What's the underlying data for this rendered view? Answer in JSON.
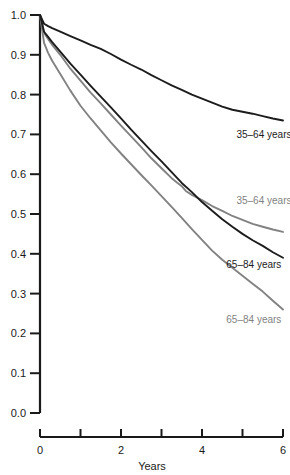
{
  "chart_data": {
    "type": "line",
    "title": "",
    "xlabel": "Years",
    "ylabel": "",
    "xlim": [
      0,
      6
    ],
    "ylim": [
      0,
      1.0
    ],
    "grid": false,
    "legend_position": "inline-annotations",
    "xticks": [
      0,
      1,
      2,
      3,
      4,
      5,
      6
    ],
    "xtick_labels": [
      "0",
      "",
      "2",
      "",
      "4",
      "",
      "6"
    ],
    "yticks": [
      0.0,
      0.1,
      0.2,
      0.3,
      0.4,
      0.5,
      0.6,
      0.7,
      0.8,
      0.9,
      1.0
    ],
    "ytick_labels": [
      "0.0",
      "0.1",
      "0.2",
      "0.3",
      "0.4",
      "0.5",
      "0.6",
      "0.7",
      "0.8",
      "0.9",
      "1.0"
    ],
    "series": [
      {
        "name": "35-64 years (upper)",
        "label": "35–64 years",
        "color": "#1c1c1c",
        "x": [
          0,
          0.1,
          0.2,
          0.3,
          0.5,
          0.75,
          1.0,
          1.25,
          1.5,
          1.75,
          2.0,
          2.25,
          2.5,
          2.75,
          3.0,
          3.25,
          3.5,
          3.75,
          4.0,
          4.25,
          4.5,
          4.75,
          5.0,
          5.25,
          5.5,
          5.75,
          6.0
        ],
        "y": [
          1.0,
          0.978,
          0.972,
          0.967,
          0.958,
          0.947,
          0.936,
          0.925,
          0.915,
          0.902,
          0.888,
          0.875,
          0.863,
          0.849,
          0.836,
          0.823,
          0.812,
          0.8,
          0.79,
          0.78,
          0.77,
          0.762,
          0.757,
          0.752,
          0.746,
          0.74,
          0.735
        ]
      },
      {
        "name": "35-64 years (lower, gray)",
        "label": "35–64 years",
        "color": "#828282",
        "x": [
          0,
          0.1,
          0.2,
          0.3,
          0.5,
          0.75,
          1.0,
          1.25,
          1.5,
          1.75,
          2.0,
          2.25,
          2.5,
          2.75,
          3.0,
          3.25,
          3.5,
          3.6,
          3.75,
          4.0,
          4.25,
          4.5,
          4.75,
          5.0,
          5.25,
          5.5,
          5.75,
          6.0
        ],
        "y": [
          1.0,
          0.955,
          0.94,
          0.925,
          0.9,
          0.865,
          0.835,
          0.805,
          0.778,
          0.75,
          0.722,
          0.695,
          0.668,
          0.64,
          0.615,
          0.59,
          0.57,
          0.558,
          0.548,
          0.535,
          0.52,
          0.508,
          0.495,
          0.485,
          0.475,
          0.468,
          0.461,
          0.455
        ]
      },
      {
        "name": "65-84 years (upper, black)",
        "label": "65–84 years",
        "color": "#1c1c1c",
        "x": [
          0,
          0.1,
          0.2,
          0.3,
          0.5,
          0.75,
          1.0,
          1.25,
          1.5,
          1.75,
          2.0,
          2.25,
          2.5,
          2.75,
          3.0,
          3.25,
          3.5,
          3.75,
          4.0,
          4.25,
          4.5,
          4.75,
          5.0,
          5.25,
          5.5,
          5.75,
          6.0
        ],
        "y": [
          1.0,
          0.958,
          0.945,
          0.932,
          0.908,
          0.878,
          0.85,
          0.822,
          0.795,
          0.768,
          0.74,
          0.712,
          0.685,
          0.658,
          0.632,
          0.605,
          0.578,
          0.555,
          0.53,
          0.508,
          0.487,
          0.468,
          0.45,
          0.434,
          0.42,
          0.404,
          0.39
        ]
      },
      {
        "name": "65-84 years (lower, gray)",
        "label": "65–84 years",
        "color": "#828282",
        "x": [
          0,
          0.1,
          0.2,
          0.3,
          0.5,
          0.75,
          1.0,
          1.25,
          1.5,
          1.75,
          2.0,
          2.25,
          2.5,
          2.75,
          3.0,
          3.25,
          3.5,
          3.75,
          4.0,
          4.25,
          4.5,
          4.75,
          5.0,
          5.25,
          5.5,
          5.75,
          6.0
        ],
        "y": [
          1.0,
          0.93,
          0.905,
          0.885,
          0.852,
          0.81,
          0.772,
          0.74,
          0.71,
          0.68,
          0.652,
          0.625,
          0.598,
          0.572,
          0.545,
          0.518,
          0.49,
          0.462,
          0.435,
          0.408,
          0.385,
          0.365,
          0.345,
          0.325,
          0.305,
          0.282,
          0.26
        ]
      }
    ],
    "annotations": [
      {
        "text": "35–64 years",
        "x": 4.85,
        "y": 0.7,
        "color": "#1c1c1c"
      },
      {
        "text": "35–64 years",
        "x": 4.85,
        "y": 0.535,
        "color": "#828282"
      },
      {
        "text": "65–84 years",
        "x": 4.6,
        "y": 0.375,
        "color": "#1c1c1c"
      },
      {
        "text": "65–84 years",
        "x": 4.6,
        "y": 0.235,
        "color": "#828282"
      }
    ]
  },
  "axes": {
    "x_title": "Years",
    "x_tick_labels": [
      "0",
      "2",
      "4",
      "6"
    ],
    "y_tick_labels": [
      "1.0",
      "0.9",
      "0.8",
      "0.7",
      "0.6",
      "0.5",
      "0.4",
      "0.3",
      "0.2",
      "0.1",
      "0.0"
    ]
  }
}
